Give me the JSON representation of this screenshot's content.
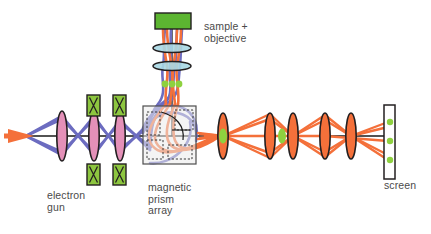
{
  "figure": {
    "background": "#ffffff"
  },
  "labels": {
    "sample_objective": "sample +\nobjective",
    "electron_gun": "electron\ngun",
    "magnetic_prism_array": "magnetic\nprism\narray",
    "screen": "screen"
  },
  "colors": {
    "beam_blue": "#6c6cc0",
    "beam_orange": "#f4703a",
    "lens_pink": "#e08bb4",
    "lens_orange": "#f4703a",
    "lens_cyan": "#a8d8e4",
    "sample_green": "#5cb531",
    "deflector_green": "#8dc63f",
    "spot_green": "#8ed13f",
    "outline_dark": "#231f20",
    "axis_black": "#1a1a1a",
    "prism_box_fill": "#eaeaea",
    "prism_box_stroke": "#4d4d4d",
    "text_gray": "#4a4a4a",
    "screen_fill": "#ffffff"
  },
  "components": {
    "source_arrow": {
      "name": "electron-source-arrow",
      "x": 14,
      "y": 135,
      "color": "#f4703a"
    },
    "gun_lenses": [
      {
        "name": "condenser-lens-1",
        "cx": 62,
        "cy": 135,
        "rx": 5.5,
        "ry": 25
      },
      {
        "name": "condenser-lens-2",
        "cx": 94,
        "cy": 135,
        "rx": 5.5,
        "ry": 25
      },
      {
        "name": "condenser-lens-3",
        "cx": 120,
        "cy": 135,
        "rx": 5.5,
        "ry": 25
      }
    ],
    "deflectors": [
      {
        "name": "deflector-top-1",
        "x": 88,
        "y": 94,
        "w": 13,
        "h": 22
      },
      {
        "name": "deflector-top-2",
        "x": 114,
        "y": 94,
        "w": 13,
        "h": 22
      },
      {
        "name": "deflector-bottom-1",
        "x": 88,
        "y": 165,
        "w": 13,
        "h": 22
      },
      {
        "name": "deflector-bottom-2",
        "x": 114,
        "y": 165,
        "w": 13,
        "h": 22
      }
    ],
    "sample": {
      "name": "sample-block",
      "x": 155,
      "y": 13,
      "w": 36,
      "h": 16
    },
    "objective_lenses": [
      {
        "name": "objective-lens-1",
        "cx": 172,
        "cy": 48,
        "rx": 19,
        "ry": 4.5
      },
      {
        "name": "objective-lens-2",
        "cx": 172,
        "cy": 66,
        "rx": 19,
        "ry": 4.5
      }
    ],
    "objective_spots": [
      {
        "name": "objective-crossover-left",
        "cx": 165,
        "cy": 84
      },
      {
        "name": "objective-crossover-center",
        "cx": 172,
        "cy": 84
      },
      {
        "name": "objective-crossover-right",
        "cx": 179,
        "cy": 84
      }
    ],
    "prism_array": {
      "name": "magnetic-prism-array-box",
      "x": 143,
      "y": 106,
      "w": 53,
      "h": 58
    },
    "projector_lenses": [
      {
        "name": "projector-lens-1",
        "cx": 223,
        "cy": 136,
        "rx": 5.5,
        "ry": 23
      },
      {
        "name": "projector-lens-2",
        "cx": 270,
        "cy": 136,
        "rx": 5.5,
        "ry": 23
      },
      {
        "name": "projector-lens-3",
        "cx": 293,
        "cy": 136,
        "rx": 5.5,
        "ry": 23
      },
      {
        "name": "projector-lens-4",
        "cx": 325,
        "cy": 136,
        "rx": 5.5,
        "ry": 23
      },
      {
        "name": "projector-lens-5",
        "cx": 351,
        "cy": 136,
        "rx": 5.5,
        "ry": 23
      }
    ],
    "projector_spots": [
      {
        "name": "crossover-spot-1",
        "cx": 223,
        "cy": 136
      },
      {
        "name": "crossover-spot-2",
        "cx": 282,
        "cy": 136
      }
    ],
    "screen": {
      "name": "detector-screen",
      "x": 384,
      "y": 105,
      "w": 11,
      "h": 74,
      "spots": [
        {
          "name": "screen-spot-top",
          "cx": 390,
          "cy": 122
        },
        {
          "name": "screen-spot-center",
          "cx": 390,
          "cy": 141
        },
        {
          "name": "screen-spot-bottom",
          "cx": 390,
          "cy": 160
        }
      ]
    },
    "optical_axis": {
      "name": "optical-axis-line",
      "y": 136,
      "x1": 26,
      "x2": 390
    }
  }
}
